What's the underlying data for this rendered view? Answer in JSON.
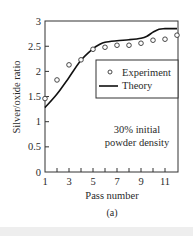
{
  "chart_data": {
    "type": "line",
    "title": "",
    "subtitle": "(a)",
    "xlabel": "Pass number",
    "ylabel": "Silver/oxide ratio",
    "xlim": [
      1,
      12
    ],
    "ylim": [
      0,
      3
    ],
    "x_ticks": [
      1,
      3,
      5,
      7,
      9,
      11
    ],
    "x_minor_ticks": [
      2,
      4,
      6,
      8,
      10,
      12
    ],
    "y_ticks": [
      0,
      0.5,
      1,
      1.5,
      2,
      2.5,
      3
    ],
    "y_tick_labels": [
      "0",
      "0.5",
      "1",
      "1.5",
      "2",
      "2.5",
      "3"
    ],
    "grid": false,
    "legend_position": "upper-right-inside",
    "annotation": [
      "30% initial",
      "powder density"
    ],
    "series": [
      {
        "name": "Experiment",
        "style": "open-circle-markers",
        "x": [
          1,
          2,
          3,
          4,
          5,
          6,
          7,
          8,
          9,
          10,
          11,
          12
        ],
        "values": [
          1.46,
          1.83,
          2.13,
          2.23,
          2.44,
          2.48,
          2.52,
          2.52,
          2.56,
          2.62,
          2.64,
          2.72
        ]
      },
      {
        "name": "Theory",
        "style": "solid-line",
        "x": [
          1,
          2,
          3,
          4,
          5,
          5.5,
          6,
          7,
          8,
          9,
          9.5,
          10,
          10.5,
          11,
          12
        ],
        "values": [
          1.28,
          1.55,
          1.88,
          2.22,
          2.45,
          2.53,
          2.58,
          2.61,
          2.63,
          2.66,
          2.7,
          2.78,
          2.84,
          2.85,
          2.85
        ]
      }
    ]
  },
  "legend": {
    "experiment_label": "Experiment",
    "theory_label": "Theory"
  },
  "annotation": {
    "line1": "30% initial",
    "line2": "powder density"
  },
  "axes": {
    "xlabel": "Pass number",
    "ylabel": "Silver/oxide ratio",
    "caption": "(a)"
  }
}
